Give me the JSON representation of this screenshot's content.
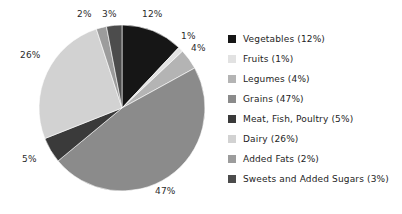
{
  "chart_data": {
    "type": "pie",
    "title": "",
    "subtitle": "",
    "xlabel": "",
    "ylabel": "",
    "grid": false,
    "legend_position": "right",
    "start_angle_deg": 0,
    "direction": "clockwise",
    "units": "percent",
    "categories": [
      "Vegetables",
      "Fruits",
      "Legumes",
      "Grains",
      "Meat, Fish, Poultry",
      "Dairy",
      "Added Fats",
      "Sweets and Added Sugars"
    ],
    "values": [
      12,
      1,
      4,
      47,
      5,
      26,
      2,
      3
    ],
    "colors": [
      "#161616",
      "#e2e2e2",
      "#b4b4b4",
      "#8b8b8b",
      "#3a3a3a",
      "#d2d2d2",
      "#9c9c9c",
      "#4c4c4c"
    ],
    "slice_labels": [
      "12%",
      "1%",
      "4%",
      "47%",
      "5%",
      "26%",
      "2%",
      "3%"
    ]
  },
  "pie": {
    "labels": [
      {
        "text": "12%",
        "left": 142,
        "top": 9
      },
      {
        "text": "1%",
        "left": 181,
        "top": 31
      },
      {
        "text": "4%",
        "left": 191,
        "top": 43
      },
      {
        "text": "47%",
        "left": 155,
        "top": 186
      },
      {
        "text": "5%",
        "left": 22,
        "top": 154
      },
      {
        "text": "26%",
        "left": 20,
        "top": 50
      },
      {
        "text": "2%",
        "left": 77,
        "top": 9
      },
      {
        "text": "3%",
        "left": 102,
        "top": 9
      }
    ]
  },
  "legend": {
    "items": [
      {
        "label": "Vegetables (12%)",
        "color": "#161616",
        "name": "vegetables"
      },
      {
        "label": "Fruits (1%)",
        "color": "#e2e2e2",
        "name": "fruits"
      },
      {
        "label": "Legumes (4%)",
        "color": "#b4b4b4",
        "name": "legumes"
      },
      {
        "label": "Grains (47%)",
        "color": "#8b8b8b",
        "name": "grains"
      },
      {
        "label": "Meat, Fish, Poultry (5%)",
        "color": "#3a3a3a",
        "name": "meat-fish-poultry"
      },
      {
        "label": "Dairy (26%)",
        "color": "#d2d2d2",
        "name": "dairy"
      },
      {
        "label": "Added Fats (2%)",
        "color": "#9c9c9c",
        "name": "added-fats"
      },
      {
        "label": "Sweets and Added Sugars (3%)",
        "color": "#4c4c4c",
        "name": "sweets-and-added-sugars"
      }
    ]
  }
}
